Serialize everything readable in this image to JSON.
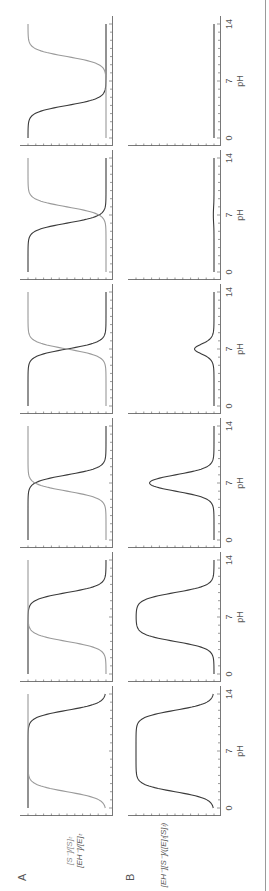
{
  "figure": {
    "orientation": "rotated-90-ccw",
    "row_labels": [
      "A",
      "B"
    ],
    "colors": {
      "enzyme_curve": "#3a3a3a",
      "substrate_curve": "#9a9a9a",
      "axis": "#555555",
      "text": "#555555"
    }
  },
  "chart_data": [
    {
      "type": "line",
      "row": "A",
      "title": "",
      "xlabel": "pH",
      "ylabel_lines": [
        "[EH-]/[E]t",
        "[S-]/[S]t"
      ],
      "ylim": [
        0,
        1
      ],
      "xlim": [
        0,
        14
      ],
      "x_ticks": [
        0,
        7,
        14
      ],
      "grid": false,
      "panels": [
        {
          "series": [
            {
              "name": "[EH-]/[E]t",
              "pKa": 12,
              "shape": "falling"
            },
            {
              "name": "[S-]/[S]t",
              "pKa": 2,
              "shape": "rising"
            }
          ]
        },
        {
          "series": [
            {
              "name": "[EH-]/[E]t",
              "pKa": 10,
              "shape": "falling"
            },
            {
              "name": "[S-]/[S]t",
              "pKa": 4,
              "shape": "rising"
            }
          ]
        },
        {
          "series": [
            {
              "name": "[EH-]/[E]t",
              "pKa": 8,
              "shape": "falling"
            },
            {
              "name": "[S-]/[S]t",
              "pKa": 6,
              "shape": "rising"
            }
          ]
        },
        {
          "series": [
            {
              "name": "[EH-]/[E]t",
              "pKa": 7,
              "shape": "falling"
            },
            {
              "name": "[S-]/[S]t",
              "pKa": 7,
              "shape": "rising"
            }
          ]
        },
        {
          "series": [
            {
              "name": "[EH-]/[E]t",
              "pKa": 6,
              "shape": "falling"
            },
            {
              "name": "[S-]/[S]t",
              "pKa": 8,
              "shape": "rising"
            }
          ]
        },
        {
          "series": [
            {
              "name": "[EH-]/[E]t",
              "pKa": 4,
              "shape": "falling"
            },
            {
              "name": "[S-]/[S]t",
              "pKa": 10,
              "shape": "rising"
            }
          ]
        }
      ]
    },
    {
      "type": "line",
      "row": "B",
      "title": "",
      "xlabel": "pH",
      "ylabel": "[EH-][S-]/([E]t[S]t)",
      "ylim": [
        0,
        1
      ],
      "xlim": [
        0,
        14
      ],
      "x_ticks": [
        0,
        7,
        14
      ],
      "grid": false,
      "panels": [
        {
          "series": [
            {
              "name": "product",
              "peak": 1.0
            }
          ]
        },
        {
          "series": [
            {
              "name": "product",
              "peak": 0.99
            }
          ]
        },
        {
          "series": [
            {
              "name": "product",
              "peak": 0.69
            }
          ]
        },
        {
          "series": [
            {
              "name": "product",
              "peak": 0.25
            }
          ]
        },
        {
          "series": [
            {
              "name": "product",
              "peak": 0.09
            }
          ]
        },
        {
          "series": [
            {
              "name": "product",
              "peak": 0.01
            }
          ]
        }
      ]
    }
  ],
  "labels": {
    "row_a": "A",
    "row_b": "B",
    "ylabel_a_line1": "[EH⁻]/[E]ₜ",
    "ylabel_a_line2": "[S⁻]/[S]ₜ",
    "ylabel_b": "[EH⁻][S⁻]/([E]ₜ[S]ₜ)",
    "xlabel": "pH",
    "tick_0": "0",
    "tick_7": "7",
    "tick_14": "14"
  }
}
